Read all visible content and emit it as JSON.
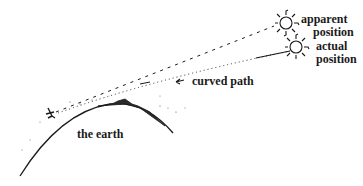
{
  "diagram": {
    "labels": {
      "apparent_line1": "apparent",
      "apparent_line2": "position",
      "actual_line1": "actual",
      "actual_line2": "position",
      "curved_path": "curved path",
      "earth": "the earth"
    },
    "elements": [
      "earth-arc",
      "observer",
      "mountain",
      "apparent-sun",
      "actual-sun",
      "dashed-line-of-sight",
      "curved-light-path",
      "arrow"
    ],
    "colors": {
      "ink": "#1a1a1a",
      "background": "#ffffff"
    }
  }
}
